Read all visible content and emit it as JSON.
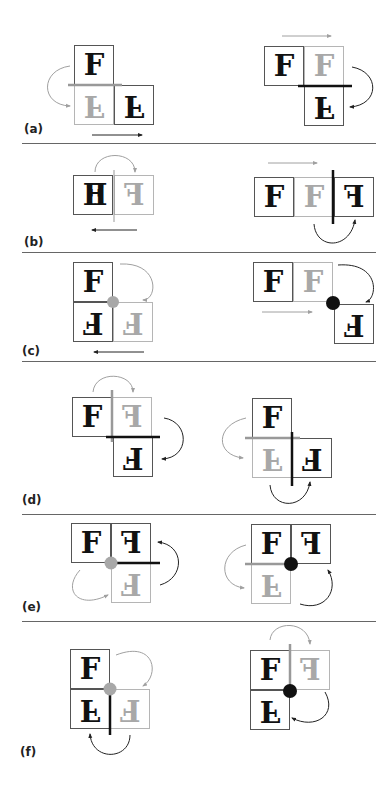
{
  "figure": {
    "panels": [
      {
        "label": "(a)",
        "left": {
          "cells": [
            {
              "glyph": "F",
              "style": "dark",
              "transform": "none"
            },
            {
              "glyph": "F",
              "style": "ghost",
              "transform": "flip-v"
            },
            {
              "glyph": "F",
              "style": "dark",
              "transform": "flip-v"
            }
          ],
          "axis": "horizontal mirror (gray)",
          "motion": "translate right"
        },
        "right": {
          "cells": [
            {
              "glyph": "F",
              "style": "dark",
              "transform": "none"
            },
            {
              "glyph": "F",
              "style": "ghost",
              "transform": "none"
            },
            {
              "glyph": "F",
              "style": "dark",
              "transform": "flip-v"
            }
          ],
          "axis": "horizontal mirror (black)",
          "motion": "translate right"
        }
      },
      {
        "label": "(b)",
        "left": {
          "cells": [
            {
              "glyph": "F",
              "style": "dark",
              "transform": "overlay F + mirrored F"
            },
            {
              "glyph": "F",
              "style": "ghost",
              "transform": "flip-h"
            }
          ],
          "axis": "vertical mirror (gray)",
          "motion": "translate left"
        },
        "right": {
          "cells": [
            {
              "glyph": "F",
              "style": "dark",
              "transform": "none"
            },
            {
              "glyph": "F",
              "style": "ghost",
              "transform": "none"
            },
            {
              "glyph": "F",
              "style": "dark",
              "transform": "flip-h"
            }
          ],
          "axis": "vertical mirror (black)",
          "motion": "translate right"
        }
      },
      {
        "label": "(c)",
        "left": {
          "cells": [
            {
              "glyph": "F",
              "style": "dark",
              "transform": "none"
            },
            {
              "glyph": "F",
              "style": "dark",
              "transform": "rot180"
            },
            {
              "glyph": "F",
              "style": "ghost",
              "transform": "rot180"
            }
          ],
          "center": "rotation point (gray)",
          "motion": "translate left"
        },
        "right": {
          "cells": [
            {
              "glyph": "F",
              "style": "dark",
              "transform": "none"
            },
            {
              "glyph": "F",
              "style": "ghost",
              "transform": "none"
            },
            {
              "glyph": "F",
              "style": "dark",
              "transform": "rot180"
            }
          ],
          "center": "rotation point (black)",
          "motion": "translate right"
        }
      },
      {
        "label": "(d)",
        "left": {
          "cells": [
            {
              "glyph": "F",
              "style": "dark",
              "transform": "none"
            },
            {
              "glyph": "F",
              "style": "ghost",
              "transform": "flip-h"
            },
            {
              "glyph": "F",
              "style": "dark",
              "transform": "rot180"
            }
          ],
          "axes": "vertical gray + horizontal black"
        },
        "right": {
          "cells": [
            {
              "glyph": "F",
              "style": "dark",
              "transform": "none"
            },
            {
              "glyph": "F",
              "style": "ghost",
              "transform": "flip-v"
            },
            {
              "glyph": "F",
              "style": "dark",
              "transform": "rot180"
            }
          ],
          "axes": "horizontal gray + vertical black"
        }
      },
      {
        "label": "(e)",
        "left": {
          "cells": [
            {
              "glyph": "F",
              "style": "dark",
              "transform": "none"
            },
            {
              "glyph": "F",
              "style": "dark",
              "transform": "flip-h"
            },
            {
              "glyph": "F",
              "style": "ghost",
              "transform": "rot180"
            }
          ],
          "elements": "gray rotation point + black horizontal axis"
        },
        "right": {
          "cells": [
            {
              "glyph": "F",
              "style": "dark",
              "transform": "none"
            },
            {
              "glyph": "F",
              "style": "dark",
              "transform": "flip-h"
            },
            {
              "glyph": "F",
              "style": "ghost",
              "transform": "flip-v"
            }
          ],
          "elements": "gray horizontal axis + black rotation point"
        }
      },
      {
        "label": "(f)",
        "left": {
          "cells": [
            {
              "glyph": "F",
              "style": "dark",
              "transform": "none"
            },
            {
              "glyph": "F",
              "style": "dark",
              "transform": "flip-v"
            },
            {
              "glyph": "F",
              "style": "ghost",
              "transform": "rot180"
            }
          ],
          "elements": "gray rotation point + black vertical axis"
        },
        "right": {
          "cells": [
            {
              "glyph": "F",
              "style": "dark",
              "transform": "none"
            },
            {
              "glyph": "F",
              "style": "ghost",
              "transform": "flip-h"
            },
            {
              "glyph": "F",
              "style": "dark",
              "transform": "flip-v"
            }
          ],
          "elements": "gray vertical axis + black rotation point"
        }
      }
    ]
  },
  "colors": {
    "dark": "#111111",
    "ghost": "#a8a8a8",
    "border_dark": "#555555",
    "border_ghost": "#b5b5b5",
    "divider": "#666666"
  }
}
